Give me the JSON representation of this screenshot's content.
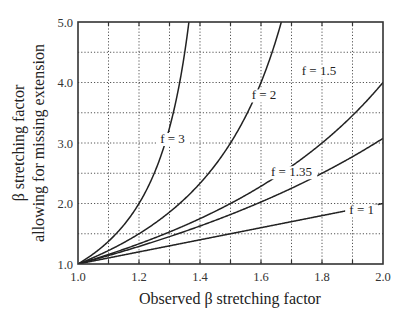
{
  "chart_data": {
    "type": "line",
    "title": "",
    "xlabel": "Observed β stretching factor",
    "ylabel_lines": [
      "β stretching factor",
      "allowing for missing extension"
    ],
    "xlim": [
      1.0,
      2.0
    ],
    "ylim": [
      1.0,
      5.0
    ],
    "x_ticks": [
      "1.0",
      "1.2",
      "1.4",
      "1.6",
      "1.8",
      "2.0"
    ],
    "x_tick_values": [
      1.0,
      1.2,
      1.4,
      1.6,
      1.8,
      2.0
    ],
    "y_ticks": [
      "1.0",
      "2.0",
      "3.0",
      "4.0",
      "5.0"
    ],
    "y_tick_values": [
      1.0,
      2.0,
      3.0,
      4.0,
      5.0
    ],
    "grid": {
      "on": true,
      "style": "dotted",
      "x_step": 0.1,
      "y_step": 0.5
    },
    "legend": "inline curve labels",
    "series": [
      {
        "name": "f = 1",
        "x": [
          1.0,
          1.2,
          1.4,
          1.6,
          1.8,
          2.0
        ],
        "y": [
          1.0,
          1.2,
          1.4,
          1.6,
          1.8,
          2.0
        ],
        "label_pos": [
          1.93,
          1.82
        ]
      },
      {
        "name": "f = 1.35",
        "x": [
          1.0,
          1.2,
          1.4,
          1.6,
          1.8,
          2.0
        ],
        "y": [
          1.0,
          1.29,
          1.63,
          2.04,
          2.5,
          3.08
        ],
        "label_pos": [
          1.7,
          2.45
        ]
      },
      {
        "name": "f = 1.5",
        "x": [
          1.0,
          1.2,
          1.4,
          1.6,
          1.8,
          2.0
        ],
        "y": [
          1.0,
          1.33,
          1.75,
          2.29,
          3.0,
          4.0
        ],
        "label_pos": [
          1.79,
          4.13
        ]
      },
      {
        "name": "f = 2",
        "x": [
          1.0,
          1.1,
          1.2,
          1.3,
          1.4,
          1.5,
          1.6,
          1.667
        ],
        "y": [
          1.0,
          1.22,
          1.5,
          1.86,
          2.33,
          3.0,
          4.0,
          5.0
        ],
        "label_pos": [
          1.61,
          3.72
        ]
      },
      {
        "name": "f = 3",
        "x": [
          1.0,
          1.05,
          1.1,
          1.15,
          1.2,
          1.25,
          1.3,
          1.333,
          1.364
        ],
        "y": [
          1.0,
          1.17,
          1.38,
          1.64,
          2.0,
          2.5,
          3.25,
          4.0,
          5.0
        ],
        "label_pos": [
          1.31,
          3.0
        ]
      }
    ]
  }
}
